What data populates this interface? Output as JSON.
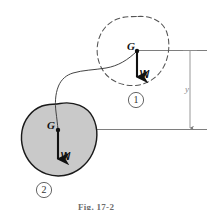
{
  "figure": {
    "caption": "Fig. 17-2",
    "dimension_label": "y",
    "bodies": [
      {
        "id": "body-1",
        "marker": "1",
        "state": "initial-dashed",
        "center_label": "G",
        "force_label": "W",
        "force_direction": "down",
        "outline_style": "dashed",
        "fill": "none",
        "outline_color": "#555555"
      },
      {
        "id": "body-2",
        "marker": "2",
        "state": "final-shaded",
        "center_label": "G",
        "force_label": "W",
        "force_direction": "down",
        "outline_style": "solid",
        "fill": "#c9c9c9",
        "outline_color": "#1a1a1a"
      }
    ],
    "trajectory": {
      "name": "center-of-gravity-path",
      "style": "solid-thin"
    },
    "reference_lines": [
      {
        "name": "datum-line-upper",
        "style": "solid-thin"
      },
      {
        "name": "datum-line-lower",
        "style": "solid-thin"
      }
    ],
    "colors": {
      "body_fill": "#c9c9c9",
      "ink": "#1a1a1a",
      "dashed_ink": "#555555",
      "thin_rule": "#707070",
      "dimension": "#8a8a8a",
      "background": "#ffffff"
    }
  }
}
